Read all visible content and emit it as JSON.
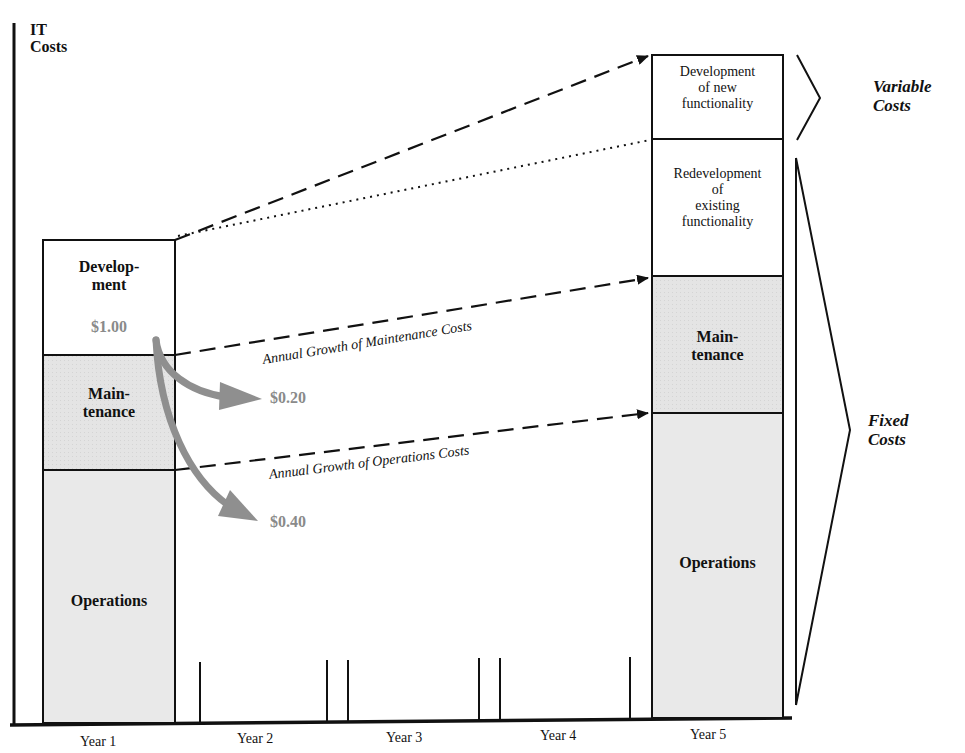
{
  "axis": {
    "y_title_line1": "IT",
    "y_title_line2": "Costs",
    "x_labels": [
      "Year 1",
      "Year 2",
      "Year 3",
      "Year 4",
      "Year 5"
    ]
  },
  "year1_bar": {
    "development_line1": "Develop-",
    "development_line2": "ment",
    "development_value": "$1.00",
    "maintenance_line1": "Main-",
    "maintenance_line2": "tenance",
    "operations": "Operations"
  },
  "year5_bar": {
    "new_dev_line1": "Development",
    "new_dev_line2": "of new",
    "new_dev_line3": "functionality",
    "redev_line1": "Redevelopment",
    "redev_line2": "of",
    "redev_line3": "existing",
    "redev_line4": "functionality",
    "maintenance_line1": "Main-",
    "maintenance_line2": "tenance",
    "operations": "Operations"
  },
  "flows": {
    "maintenance_share": "$0.20",
    "operations_share": "$0.40",
    "maintenance_growth_label": "Annual Growth of Maintenance Costs",
    "operations_growth_label": "Annual Growth of Operations Costs"
  },
  "brackets": {
    "variable_line1": "Variable",
    "variable_line2": "Costs",
    "fixed_line1": "Fixed",
    "fixed_line2": "Costs"
  },
  "colors": {
    "shaded_fill": "#e6e6e6",
    "flow_arrow": "#8f8f8f",
    "money_text": "#8a8a8a",
    "line": "#111111"
  }
}
